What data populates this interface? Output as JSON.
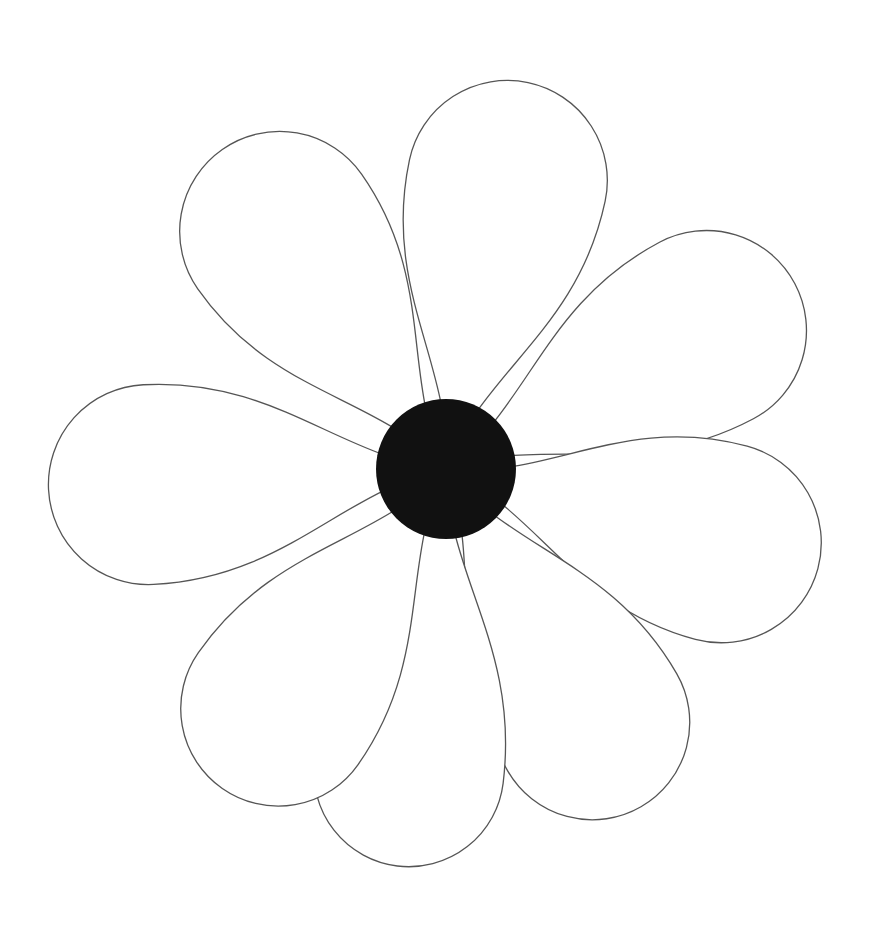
{
  "image": {
    "subject": "flower line drawing",
    "background_color": "#ffffff",
    "stroke_color": "#555555",
    "center_color": "#111111",
    "center": {
      "x": 446,
      "y": 469,
      "r": 70
    },
    "petals": [
      {
        "name": "top",
        "angle": -78,
        "length": 395,
        "width": 200
      },
      {
        "name": "upper-right",
        "angle": -28,
        "length": 395,
        "width": 200
      },
      {
        "name": "right",
        "angle": 15,
        "length": 385,
        "width": 200
      },
      {
        "name": "lower-right",
        "angle": 60,
        "length": 390,
        "width": 195
      },
      {
        "name": "bottom",
        "angle": 97,
        "length": 400,
        "width": 190
      },
      {
        "name": "lower-left",
        "angle": 125,
        "length": 390,
        "width": 195
      },
      {
        "name": "left",
        "angle": 177,
        "length": 398,
        "width": 200
      },
      {
        "name": "upper-left",
        "angle": -125,
        "length": 390,
        "width": 200
      }
    ]
  }
}
